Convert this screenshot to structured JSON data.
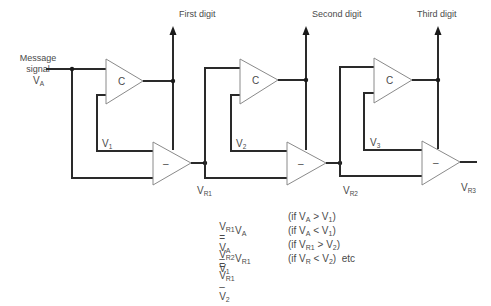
{
  "input": {
    "label_line1": "Message",
    "label_line2": "signal",
    "symbol": "V",
    "symbol_sub": "A"
  },
  "outputs": [
    {
      "label": "First digit"
    },
    {
      "label": "Second digit"
    },
    {
      "label": "Third digit"
    }
  ],
  "stages": [
    {
      "comparator_label": "C",
      "subtractor_label": "–",
      "ref_symbol": "V",
      "ref_sub": "1",
      "residual_symbol": "V",
      "residual_sub": "R1"
    },
    {
      "comparator_label": "C",
      "subtractor_label": "–",
      "ref_symbol": "V",
      "ref_sub": "2",
      "residual_symbol": "V",
      "residual_sub": "R2"
    },
    {
      "comparator_label": "C",
      "subtractor_label": "–",
      "ref_symbol": "V",
      "ref_sub": "3",
      "residual_symbol": "V",
      "residual_sub": "R3"
    }
  ],
  "equations": [
    {
      "lhs": "V",
      "lhs_sub": "R1",
      "eq": "=",
      "t1": "V",
      "t1_sub": "A",
      "op": "–",
      "t2": "V",
      "t2_sub": "1",
      "cond_pre": "(if V",
      "cond_a_sub": "A",
      "cond_op": " > V",
      "cond_b_sub": "1",
      "cond_post": ")",
      "tail": ""
    },
    {
      "lhs": "",
      "lhs_sub": "",
      "eq": "",
      "t1": "V",
      "t1_sub": "A",
      "op": "",
      "t2": "",
      "t2_sub": "",
      "cond_pre": "(if V",
      "cond_a_sub": "A",
      "cond_op": " < V",
      "cond_b_sub": "1",
      "cond_post": ")",
      "tail": ""
    },
    {
      "lhs": "V",
      "lhs_sub": "R2",
      "eq": "=",
      "t1": "V",
      "t1_sub": "R1",
      "op": "–",
      "t2": "V",
      "t2_sub": "2",
      "cond_pre": "(if V",
      "cond_a_sub": "R1",
      "cond_op": " > V",
      "cond_b_sub": "2",
      "cond_post": ")",
      "tail": ""
    },
    {
      "lhs": "",
      "lhs_sub": "",
      "eq": "",
      "t1": "V",
      "t1_sub": "R1",
      "op": "",
      "t2": "",
      "t2_sub": "",
      "cond_pre": "(if V",
      "cond_a_sub": "R",
      "cond_op": " < V",
      "cond_b_sub": "2",
      "cond_post": ")",
      "tail": "etc"
    }
  ]
}
